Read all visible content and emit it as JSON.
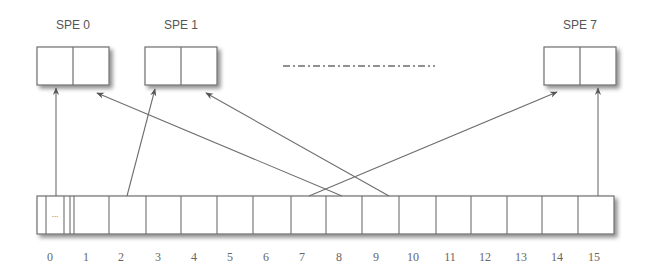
{
  "diagram": {
    "spes": [
      {
        "label": "SPE 0",
        "x": 37,
        "label_x": 73
      },
      {
        "label": "SPE 1",
        "x": 145,
        "label_x": 181
      },
      {
        "label": "SPE 7",
        "x": 544,
        "label_x": 580
      }
    ],
    "ellipsis_line": {
      "x1": 283,
      "x2": 435,
      "y": 66,
      "style": "dash-dot"
    },
    "array": {
      "x": 37,
      "y": 196,
      "width": 577,
      "height": 38,
      "first_cell_dots": "...",
      "indices": [
        "0",
        "1",
        "2",
        "3",
        "4",
        "5",
        "6",
        "7",
        "8",
        "9",
        "10",
        "11",
        "12",
        "13",
        "14",
        "15"
      ],
      "index_x": [
        50,
        86,
        121,
        158,
        194,
        230,
        266,
        302,
        339,
        376,
        413,
        450,
        485,
        521,
        557,
        594
      ],
      "cell_dividers": [
        46,
        64,
        70,
        74,
        109,
        146,
        181,
        217,
        253,
        291,
        326,
        362,
        399,
        436,
        471,
        507,
        542,
        578
      ]
    },
    "arrows": [
      {
        "from": "array-cell-0",
        "to": "SPE 0 left",
        "x1": 56,
        "y1": 196,
        "x2": 56,
        "y2": 88
      },
      {
        "from": "array-cell-2",
        "to": "SPE 1 left",
        "x1": 127,
        "y1": 196,
        "x2": 155,
        "y2": 89
      },
      {
        "from": "array-cell-8",
        "to": "SPE 0 right",
        "x1": 342,
        "y1": 196,
        "x2": 97,
        "y2": 93
      },
      {
        "from": "array-cell-9",
        "to": "SPE 1 right",
        "x1": 389,
        "y1": 196,
        "x2": 206,
        "y2": 93
      },
      {
        "from": "array-cell-7",
        "to": "SPE 7 left",
        "x1": 309,
        "y1": 196,
        "x2": 557,
        "y2": 92
      },
      {
        "from": "array-cell-15",
        "to": "SPE 7 right",
        "x1": 598,
        "y1": 196,
        "x2": 598,
        "y2": 88
      }
    ],
    "colors": {
      "stroke": "#6e6e6e",
      "shadow": "#bdbdbd",
      "text": "#555555"
    }
  }
}
